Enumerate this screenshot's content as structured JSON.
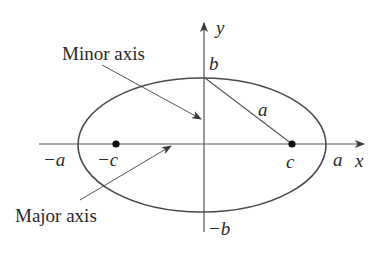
{
  "figure": {
    "type": "ellipse-diagram",
    "annotations": {
      "minor_axis": "Minor axis",
      "major_axis": "Major axis"
    },
    "axis_labels": {
      "x": "x",
      "y": "y"
    },
    "point_labels": {
      "neg_a": "−a",
      "pos_a": "a",
      "neg_c": "−c",
      "pos_c": "c",
      "pos_b": "b",
      "neg_b": "−b",
      "segment_a": "a"
    },
    "colors": {
      "stroke": "#4a4a4a",
      "text": "#2a2a2a",
      "background": "#ffffff"
    }
  }
}
